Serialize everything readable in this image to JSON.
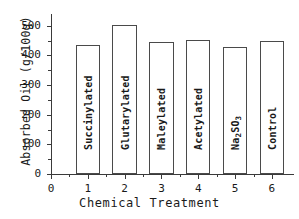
{
  "chart_data": {
    "type": "bar",
    "title": "",
    "xlabel": "Chemical Treatment",
    "ylabel": "Absorbed Oil (g/100g)",
    "ylabel_parts": {
      "main": "Absorbed Oil (g/100g)"
    },
    "categories": [
      "Succinylated",
      "Glutarylated",
      "Maleylated",
      "Acetylated",
      "Na2SO3",
      "Control"
    ],
    "category_labels_html": [
      "Succinylated",
      "Glutarylated",
      "Maleylated",
      "Acetylated",
      "Na<sub>2</sub>SO<sub>3</sub>",
      "Control"
    ],
    "x_positions": [
      1,
      2,
      3,
      4,
      5,
      6
    ],
    "values": [
      437,
      503,
      444,
      451,
      428,
      448
    ],
    "ylim": [
      0,
      540
    ],
    "xlim": [
      0,
      6.6
    ],
    "ytick_values": [
      0,
      100,
      200,
      300,
      400,
      500
    ],
    "ytick_labels": [
      "0",
      "100",
      "200",
      "300",
      "400",
      "500"
    ],
    "yminor_tick_values": [
      50,
      150,
      250,
      350,
      450
    ],
    "xtick_values": [
      0,
      1,
      2,
      3,
      4,
      5,
      6
    ],
    "xtick_labels": [
      "0",
      "1",
      "2",
      "3",
      "4",
      "5",
      "6"
    ],
    "grid": false,
    "legend": null,
    "bar_fill": "#ffffff",
    "bar_edge": "#4a4a4a",
    "axis_color": "#3a3a3a",
    "background": "#ffffff"
  }
}
